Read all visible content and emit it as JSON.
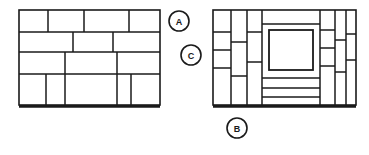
{
  "figure": {
    "background_color": "#ffffff",
    "line_color": "#1a1a1a",
    "fill_color": "#ffffff",
    "canvas": {
      "width": 369,
      "height": 155
    }
  },
  "panels": [
    {
      "id": "left-panel",
      "name": "Left panel layout",
      "x": 19,
      "y": 10,
      "width": 141,
      "height": 98,
      "outer_stroke": 1.6,
      "base_stroke": 2.6,
      "rows": [
        {
          "name": "row-1",
          "y_top": 10,
          "y_bottom": 32,
          "splits": [
            48,
            84,
            129
          ]
        },
        {
          "name": "row-2",
          "y_top": 32,
          "y_bottom": 52,
          "splits": [
            73,
            113
          ]
        },
        {
          "name": "row-3",
          "y_top": 52,
          "y_bottom": 74,
          "splits": [
            65,
            117
          ]
        },
        {
          "name": "row-4",
          "y_top": 74,
          "y_bottom": 105,
          "splits": [
            46,
            65,
            117,
            131
          ]
        }
      ],
      "horizontal_rules": [
        32,
        52,
        74,
        105
      ]
    },
    {
      "id": "right-panel",
      "name": "Right panel layout",
      "x": 213,
      "y": 10,
      "width": 143,
      "height": 98,
      "outer_stroke": 1.6,
      "base_stroke": 2.6,
      "vertical_rules": [
        231,
        247,
        262,
        320,
        335,
        346
      ],
      "left_block_rules": [
        32,
        50,
        68,
        86
      ],
      "left_mid_rules": [
        42,
        76
      ],
      "center_rules": [
        26,
        82,
        90,
        98
      ],
      "right_block_rules": [
        30,
        48,
        66
      ],
      "far_right_rules": [
        34,
        60
      ],
      "center_box": {
        "name": "center-inner-box",
        "x": 268,
        "y": 30,
        "width": 45,
        "height": 40
      }
    }
  ],
  "callouts": [
    {
      "id": "callout-a",
      "label": "A",
      "cx": 179,
      "cy": 21,
      "r": 10
    },
    {
      "id": "callout-c",
      "label": "C",
      "cx": 191,
      "cy": 55,
      "r": 10
    },
    {
      "id": "callout-b",
      "label": "B",
      "cx": 237,
      "cy": 128,
      "r": 10
    }
  ]
}
